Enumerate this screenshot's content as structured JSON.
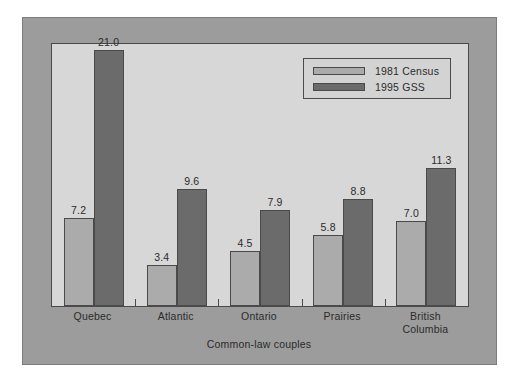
{
  "chart_data": {
    "type": "bar",
    "title": "",
    "subtitle": "",
    "xlabel": "Common-law couples",
    "ylabel": "",
    "ylim": [
      0,
      21.5
    ],
    "grid": false,
    "legend_position": "top-right",
    "categories": [
      "Quebec",
      "Atlantic",
      "Ontario",
      "Prairies",
      "British\nColumbia"
    ],
    "series": [
      {
        "name": "1981 Census",
        "color": "#ababab",
        "values": [
          7.2,
          3.4,
          4.5,
          5.8,
          7.0
        ],
        "labels": [
          "7.2",
          "3.4",
          "4.5",
          "5.8",
          "7.0"
        ]
      },
      {
        "name": "1995 GSS",
        "color": "#6b6b6b",
        "values": [
          21.0,
          9.6,
          7.9,
          8.8,
          11.3
        ],
        "labels": [
          "21.0",
          "9.6",
          "7.9",
          "8.8",
          "11.3"
        ]
      }
    ]
  },
  "legend": {
    "entries": [
      {
        "label": "1981 Census"
      },
      {
        "label": "1995 GSS"
      }
    ]
  },
  "axis": {
    "title": "Common-law couples",
    "categories": [
      "Quebec",
      "Atlantic",
      "Ontario",
      "Prairies",
      "British\nColumbia"
    ]
  },
  "colors": {
    "page_background": "#ffffff",
    "frame": "#9c9c9c",
    "panel": "#d7d7d7",
    "series_1981": "#ababab",
    "series_1995": "#6b6b6b",
    "outline": "#4a4a4a",
    "text": "#2b2b2b"
  }
}
